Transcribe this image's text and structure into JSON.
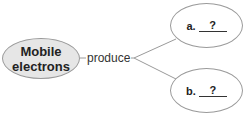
{
  "diagram": {
    "type": "concept-map",
    "source_node": {
      "label": "Mobile electrons",
      "fill": "#e6e6e6",
      "border": "#9a9a9a"
    },
    "link": {
      "label": "produce",
      "line_color": "#9a9a9a"
    },
    "targets": [
      {
        "letter": "a.",
        "blank": "?",
        "fill": "#ffffff"
      },
      {
        "letter": "b.",
        "blank": "?",
        "fill": "#ffffff"
      }
    ]
  }
}
